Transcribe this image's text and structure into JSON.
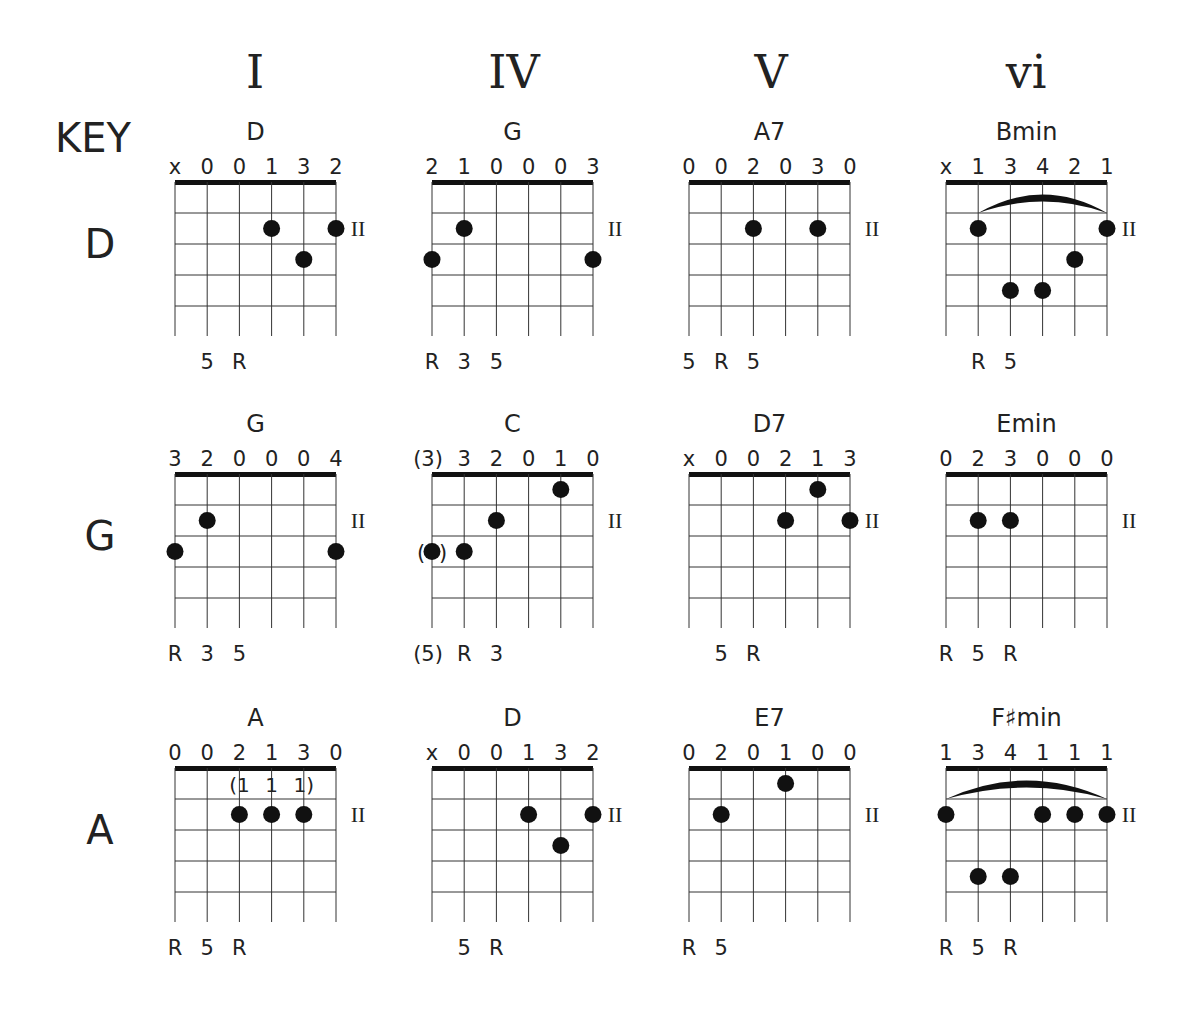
{
  "key_header": "KEY",
  "columns": [
    {
      "numeral": "I",
      "center_x": 255
    },
    {
      "numeral": "IV",
      "center_x": 514
    },
    {
      "numeral": "V",
      "center_x": 771
    },
    {
      "numeral": "vi",
      "center_x": 1026
    }
  ],
  "fret_marker": "II",
  "rows": [
    {
      "key": "D",
      "nut_y": 182,
      "chords": [
        {
          "name": "D",
          "fingers": [
            "x",
            "0",
            "0",
            "1",
            "3",
            "2"
          ],
          "dots": [
            [
              3,
              2
            ],
            [
              5,
              2
            ],
            [
              4,
              3
            ]
          ],
          "bottom": [
            null,
            "5",
            "R",
            null,
            null,
            null
          ]
        },
        {
          "name": "G",
          "fingers": [
            "2",
            "1",
            "0",
            "0",
            "0",
            "3"
          ],
          "dots": [
            [
              1,
              2
            ],
            [
              0,
              3
            ],
            [
              5,
              3
            ]
          ],
          "bottom": [
            "R",
            "3",
            "5",
            null,
            null,
            null
          ]
        },
        {
          "name": "A7",
          "fingers": [
            "0",
            "0",
            "2",
            "0",
            "3",
            "0"
          ],
          "dots": [
            [
              2,
              2
            ],
            [
              4,
              2
            ]
          ],
          "bottom": [
            "5",
            "R",
            "5",
            null,
            null,
            null
          ]
        },
        {
          "name": "Bmin",
          "fingers": [
            "x",
            "1",
            "3",
            "4",
            "2",
            "1"
          ],
          "dots": [
            [
              1,
              2
            ],
            [
              5,
              2
            ],
            [
              4,
              3
            ],
            [
              2,
              4
            ],
            [
              3,
              4
            ]
          ],
          "barre": [
            1,
            5
          ],
          "bottom": [
            null,
            "R",
            "5",
            null,
            null,
            null
          ]
        }
      ]
    },
    {
      "key": "G",
      "nut_y": 474,
      "chords": [
        {
          "name": "G",
          "fingers": [
            "3",
            "2",
            "0",
            "0",
            "0",
            "4"
          ],
          "dots": [
            [
              1,
              2
            ],
            [
              0,
              3
            ],
            [
              5,
              3
            ]
          ],
          "bottom": [
            "R",
            "3",
            "5",
            null,
            null,
            null
          ]
        },
        {
          "name": "C",
          "fingers": [
            "(3)",
            "3",
            "2",
            "0",
            "1",
            "0"
          ],
          "dots": [
            [
              4,
              1
            ],
            [
              2,
              2
            ],
            [
              1,
              3
            ],
            [
              0,
              3
            ]
          ],
          "optional_dot": [
            0,
            3
          ],
          "bottom": [
            "(5)",
            "R",
            "3",
            null,
            null,
            null
          ]
        },
        {
          "name": "D7",
          "fingers": [
            "x",
            "0",
            "0",
            "2",
            "1",
            "3"
          ],
          "dots": [
            [
              4,
              1
            ],
            [
              3,
              2
            ],
            [
              5,
              2
            ]
          ],
          "bottom": [
            null,
            "5",
            "R",
            null,
            null,
            null
          ]
        },
        {
          "name": "Emin",
          "fingers": [
            "0",
            "2",
            "3",
            "0",
            "0",
            "0"
          ],
          "dots": [
            [
              1,
              2
            ],
            [
              2,
              2
            ]
          ],
          "bottom": [
            "R",
            "5",
            "R",
            null,
            null,
            null
          ]
        }
      ]
    },
    {
      "key": "A",
      "nut_y": 768,
      "chords": [
        {
          "name": "A",
          "fingers": [
            "0",
            "0",
            "2",
            "1",
            "3",
            "0"
          ],
          "dots": [
            [
              2,
              2
            ],
            [
              3,
              2
            ],
            [
              4,
              2
            ]
          ],
          "inner_fingers": [
            "(1",
            "1",
            "1)"
          ],
          "bottom": [
            "R",
            "5",
            "R",
            null,
            null,
            null
          ]
        },
        {
          "name": "D",
          "fingers": [
            "x",
            "0",
            "0",
            "1",
            "3",
            "2"
          ],
          "dots": [
            [
              3,
              2
            ],
            [
              5,
              2
            ],
            [
              4,
              3
            ]
          ],
          "bottom": [
            null,
            "5",
            "R",
            null,
            null,
            null
          ]
        },
        {
          "name": "E7",
          "fingers": [
            "0",
            "2",
            "0",
            "1",
            "0",
            "0"
          ],
          "dots": [
            [
              3,
              1
            ],
            [
              1,
              2
            ]
          ],
          "bottom": [
            "R",
            "5",
            null,
            null,
            null,
            null
          ]
        },
        {
          "name": "F♯min",
          "fingers": [
            "1",
            "3",
            "4",
            "1",
            "1",
            "1"
          ],
          "dots": [
            [
              0,
              2
            ],
            [
              3,
              2
            ],
            [
              4,
              2
            ],
            [
              5,
              2
            ],
            [
              1,
              4
            ],
            [
              2,
              4
            ]
          ],
          "barre": [
            0,
            5
          ],
          "bottom": [
            "R",
            "5",
            "R",
            null,
            null,
            null
          ]
        }
      ]
    }
  ],
  "layout": {
    "grid_lefts": [
      175,
      432,
      689,
      946
    ],
    "string_spacing": 32.2,
    "fret_spacing": 31,
    "frets": 5
  }
}
